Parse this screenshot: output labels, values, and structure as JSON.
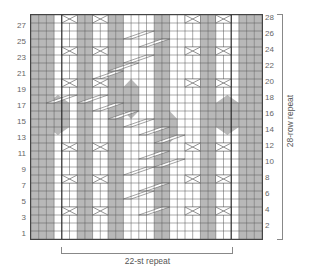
{
  "chart": {
    "cols": 30,
    "rows": 28,
    "cell_w": 7.7,
    "cell_h": 8,
    "colors": {
      "gray": "#b8b8b8",
      "white": "#ffffff",
      "grid": "#555555",
      "cross": "#666666",
      "repeat_line": "#222222"
    },
    "gray_columns_base": [
      1,
      2,
      3,
      7,
      8,
      11,
      12,
      17,
      18,
      23,
      24,
      28,
      29,
      30
    ],
    "repeat_boundaries": [
      4,
      26
    ],
    "hexagons": [
      {
        "col": 3,
        "row_from": 14,
        "row_to": 18,
        "width": 3
      },
      {
        "col": 13,
        "row_from": 16,
        "row_to": 20,
        "width": 2
      },
      {
        "col": 18,
        "row_from": 13,
        "row_to": 16,
        "width": 2
      },
      {
        "col": 25,
        "row_from": 14,
        "row_to": 18,
        "width": 3
      }
    ],
    "crossings": [
      {
        "row": 28,
        "col": 5,
        "w": 2
      },
      {
        "row": 28,
        "col": 9,
        "w": 2
      },
      {
        "row": 28,
        "col": 21,
        "w": 2
      },
      {
        "row": 28,
        "col": 25,
        "w": 2
      },
      {
        "row": 24,
        "col": 5,
        "w": 2
      },
      {
        "row": 24,
        "col": 9,
        "w": 2
      },
      {
        "row": 24,
        "col": 21,
        "w": 2
      },
      {
        "row": 24,
        "col": 25,
        "w": 2
      },
      {
        "row": 20,
        "col": 5,
        "w": 2
      },
      {
        "row": 20,
        "col": 9,
        "w": 2
      },
      {
        "row": 20,
        "col": 21,
        "w": 2
      },
      {
        "row": 20,
        "col": 25,
        "w": 2
      },
      {
        "row": 12,
        "col": 5,
        "w": 2
      },
      {
        "row": 12,
        "col": 9,
        "w": 2
      },
      {
        "row": 12,
        "col": 21,
        "w": 2
      },
      {
        "row": 12,
        "col": 25,
        "w": 2
      },
      {
        "row": 8,
        "col": 5,
        "w": 2
      },
      {
        "row": 8,
        "col": 9,
        "w": 2
      },
      {
        "row": 8,
        "col": 21,
        "w": 2
      },
      {
        "row": 8,
        "col": 25,
        "w": 2
      },
      {
        "row": 4,
        "col": 5,
        "w": 2
      },
      {
        "row": 4,
        "col": 9,
        "w": 2
      },
      {
        "row": 4,
        "col": 21,
        "w": 2
      },
      {
        "row": 4,
        "col": 25,
        "w": 2
      }
    ],
    "diagonals": [
      {
        "row": 26,
        "col": 13,
        "w": 3
      },
      {
        "row": 25,
        "col": 15,
        "w": 3
      },
      {
        "row": 23,
        "col": 13,
        "w": 3
      },
      {
        "row": 22,
        "col": 11,
        "w": 3
      },
      {
        "row": 21,
        "col": 9,
        "w": 3
      },
      {
        "row": 18,
        "col": 3,
        "w": 3
      },
      {
        "row": 18,
        "col": 7,
        "w": 3
      },
      {
        "row": 17,
        "col": 9,
        "w": 3
      },
      {
        "row": 16,
        "col": 11,
        "w": 3
      },
      {
        "row": 15,
        "col": 13,
        "w": 3
      },
      {
        "row": 14,
        "col": 15,
        "w": 3
      },
      {
        "row": 13,
        "col": 17,
        "w": 3
      },
      {
        "row": 11,
        "col": 15,
        "w": 3
      },
      {
        "row": 10,
        "col": 17,
        "w": 3
      },
      {
        "row": 9,
        "col": 13,
        "w": 3
      },
      {
        "row": 7,
        "col": 15,
        "w": 3
      },
      {
        "row": 6,
        "col": 13,
        "w": 3
      },
      {
        "row": 4,
        "col": 15,
        "w": 3
      }
    ]
  },
  "row_labels_left": [
    "27",
    "25",
    "23",
    "21",
    "19",
    "17",
    "15",
    "13",
    "11",
    "9",
    "7",
    "5",
    "3",
    "1"
  ],
  "row_labels_right": [
    "28",
    "26",
    "24",
    "22",
    "20",
    "18",
    "16",
    "14",
    "12",
    "10",
    "8",
    "6",
    "4",
    "2"
  ],
  "stitch_repeat_label": "22-st repeat",
  "row_repeat_label": "28-row repeat"
}
